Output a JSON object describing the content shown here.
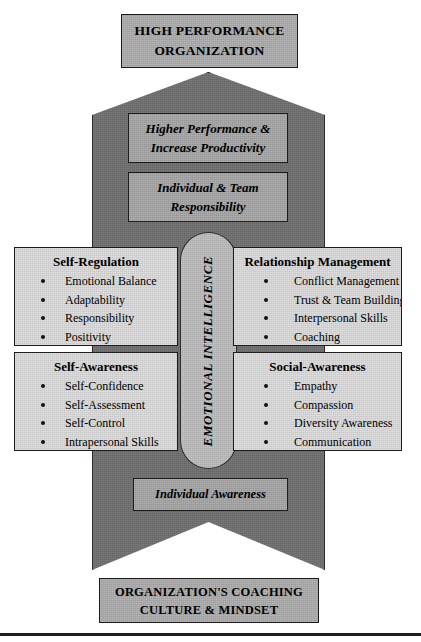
{
  "diagram": {
    "top_cap": {
      "lines": [
        "HIGH PERFORMANCE",
        "ORGANIZATION"
      ]
    },
    "arrow_banners": [
      {
        "name": "higher-performance",
        "lines": [
          "Higher Performance &",
          "Increase Productivity"
        ]
      },
      {
        "name": "individual-team",
        "lines": [
          "Individual & Team",
          "Responsibility"
        ]
      }
    ],
    "center": {
      "label": "EMOTIONAL INTELLIGENCE"
    },
    "quadrants": [
      {
        "id": "self-regulation",
        "title": "Self-Regulation",
        "items": [
          "Emotional Balance",
          "Adaptability",
          "Responsibility",
          "Positivity"
        ]
      },
      {
        "id": "relationship-management",
        "title": "Relationship Management",
        "items": [
          "Conflict Management",
          "Trust & Team Building",
          "Interpersonal Skills",
          "Coaching"
        ]
      },
      {
        "id": "self-awareness",
        "title": "Self-Awareness",
        "items": [
          "Self-Confidence",
          "Self-Assessment",
          "Self-Control",
          "Intrapersonal Skills"
        ]
      },
      {
        "id": "social-awareness",
        "title": "Social-Awareness",
        "items": [
          "Empathy",
          "Compassion",
          "Diversity Awareness",
          "Communication"
        ]
      }
    ],
    "bottom_banner": {
      "lines": [
        "Individual Awareness"
      ]
    },
    "bottom_cap": {
      "lines": [
        "ORGANIZATION'S COACHING",
        "CULTURE & MINDSET"
      ]
    },
    "colors": {
      "arrow_fill": "#6e6e6e",
      "cap_fill": "#adadad",
      "banner_fill": "#a6a6a6",
      "ellipse_fill": "#bdbdbd",
      "quadrant_fill": "#dcdcdc",
      "outline": "#1c1c1c"
    }
  }
}
